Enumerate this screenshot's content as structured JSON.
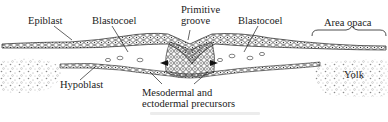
{
  "figure": {
    "type": "embryo cross-section",
    "labels": {
      "epiblast": "Epiblast",
      "blastocoel_left": "Blastocoel",
      "primitive_groove_line1": "Primitive",
      "primitive_groove_line2": "groove",
      "blastocoel_right": "Blastocoel",
      "area_opaca": "Area opaca",
      "hypoblast": "Hypoblast",
      "mesodermal_line1": "Mesodermal and",
      "mesodermal_line2": "ectodermal precursors",
      "yolk": "Yolk"
    },
    "colors": {
      "ink": "#1a1a1a",
      "background": "#ffffff",
      "yolk_stipple": "#9a9a9a"
    }
  }
}
